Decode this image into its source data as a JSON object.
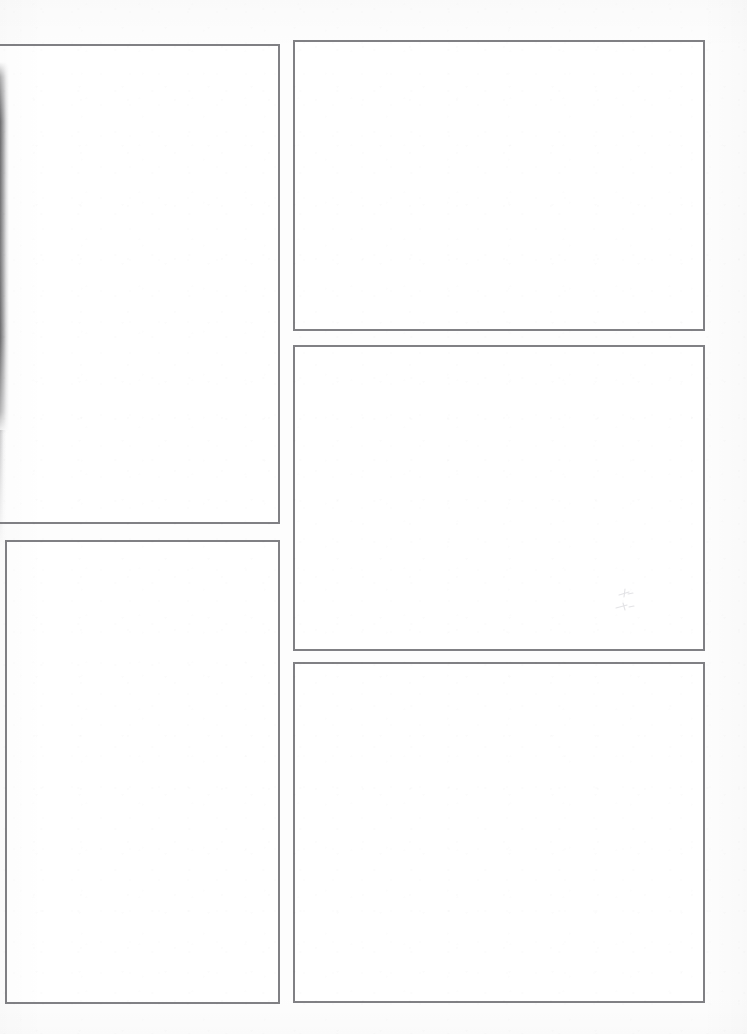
{
  "document": {
    "kind": "scanned-blank-comic-page",
    "title": "Blank Comic Page Template",
    "page_width": 747,
    "page_height": 1034,
    "background_color": "#fdfdfd",
    "panel_fill_color": "#ffffff",
    "panel_border_color": "#808084",
    "panel_border_width": 2,
    "panel_count": 5,
    "column_count": 2,
    "text_content": "",
    "notes": "All panels are empty; no text, artwork, lettering, captions or page numbers appear anywhere on the page."
  },
  "layout": {
    "columns": [
      {
        "name": "left-column",
        "label": "Left column",
        "x": 0,
        "width": 279,
        "panel_count": 2
      },
      {
        "name": "right-column",
        "label": "Right column",
        "x": 293,
        "width": 412,
        "panel_count": 3
      }
    ],
    "gutters": {
      "column_gutter": 14,
      "left_column_row_gutter": 17,
      "right_column_row_gutter_1": 15,
      "right_column_row_gutter_2": 12
    }
  },
  "panels": [
    {
      "id": "panel-1",
      "name": "panel-top-left",
      "label": "Panel 1",
      "column": "left-column",
      "row": 1,
      "shape": "portrait",
      "x": 0,
      "y": 44,
      "width": 280,
      "height": 480,
      "clipped_edge": "left",
      "content": ""
    },
    {
      "id": "panel-2",
      "name": "panel-top-right",
      "label": "Panel 2",
      "column": "right-column",
      "row": 1,
      "shape": "landscape",
      "x": 293,
      "y": 40,
      "width": 412,
      "height": 291,
      "clipped_edge": "",
      "content": ""
    },
    {
      "id": "panel-3",
      "name": "panel-middle-right",
      "label": "Panel 3",
      "column": "right-column",
      "row": 2,
      "shape": "landscape",
      "x": 293,
      "y": 345,
      "width": 412,
      "height": 306,
      "clipped_edge": "",
      "content": ""
    },
    {
      "id": "panel-4",
      "name": "panel-bottom-left",
      "label": "Panel 4",
      "column": "left-column",
      "row": 2,
      "shape": "portrait",
      "x": 5,
      "y": 540,
      "width": 275,
      "height": 464,
      "clipped_edge": "",
      "content": ""
    },
    {
      "id": "panel-5",
      "name": "panel-bottom-right",
      "label": "Panel 5",
      "column": "right-column",
      "row": 3,
      "shape": "landscape",
      "x": 293,
      "y": 662,
      "width": 412,
      "height": 341,
      "clipped_edge": "",
      "content": ""
    }
  ],
  "artifacts": [
    {
      "id": "artifact-1",
      "name": "scan-edge-shadow",
      "label": "Dark scanner edge band",
      "type": "scan-shadow",
      "x": 0,
      "y": 62,
      "width": 9,
      "height": 372,
      "color": "#46464 8"
    },
    {
      "id": "artifact-2",
      "name": "graphite-smudge",
      "label": "Faint pencil smudge",
      "type": "smudge",
      "x": 612,
      "y": 586,
      "width": 34,
      "height": 30,
      "color": "#d8d8dc"
    }
  ]
}
